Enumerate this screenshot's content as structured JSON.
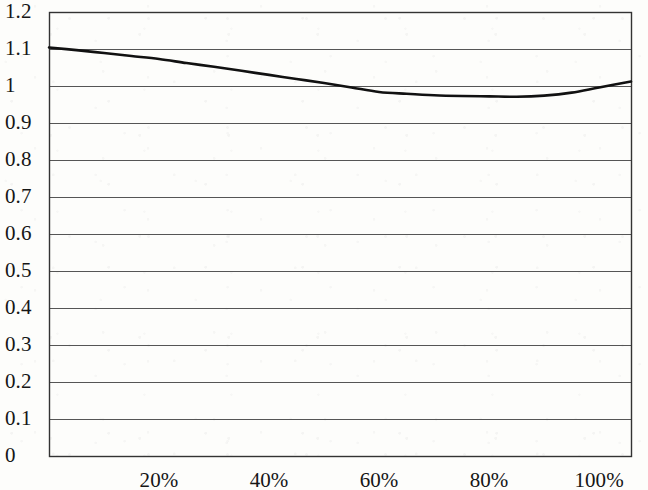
{
  "chart_data": {
    "type": "line",
    "title": "",
    "subtitle": "",
    "xlabel": "",
    "ylabel": "",
    "xlim": [
      0,
      105.8
    ],
    "ylim": [
      0,
      1.2
    ],
    "grid": true,
    "grid_axis": "y",
    "legend": false,
    "legend_position": "none",
    "x_tick_labels": [
      "20%",
      "40%",
      "60%",
      "80%",
      "100%"
    ],
    "x_tick_values": [
      20,
      40,
      60,
      80,
      100
    ],
    "y_tick_labels": [
      "1.2",
      "1.1",
      "1",
      "0.9",
      "0.8",
      "0.7",
      "0.6",
      "0.5",
      "0.4",
      "0.3",
      "0.2",
      "0.1",
      "0"
    ],
    "y_tick_values": [
      1.2,
      1.1,
      1.0,
      0.9,
      0.8,
      0.7,
      0.6,
      0.5,
      0.4,
      0.3,
      0.2,
      0.1,
      0.0
    ],
    "series": [
      {
        "name": "",
        "color": "#111111",
        "line_width": 2.6,
        "x": [
          0,
          5,
          10,
          15,
          20,
          25,
          30,
          35,
          40,
          45,
          50,
          55,
          60,
          65,
          70,
          75,
          80,
          85,
          90,
          95,
          100,
          105.8
        ],
        "y": [
          1.104,
          1.097,
          1.089,
          1.081,
          1.073,
          1.062,
          1.052,
          1.041,
          1.03,
          1.019,
          1.008,
          0.996,
          0.984,
          0.979,
          0.975,
          0.973,
          0.972,
          0.971,
          0.974,
          0.982,
          0.996,
          1.012
        ]
      }
    ],
    "colors": {
      "line": "#111111",
      "gridline": "#555555",
      "axis": "#333333",
      "background": "#fdfdfb",
      "text": "#161616"
    },
    "plot_area_px": {
      "left": 49,
      "top": 12,
      "right": 631,
      "bottom": 456
    }
  }
}
